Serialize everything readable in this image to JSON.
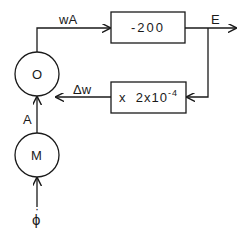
{
  "diagram": {
    "nodes": {
      "o_node": {
        "label": "O"
      },
      "m_node": {
        "label": "M"
      },
      "gain_box": {
        "label": "-200"
      },
      "rate_box": {
        "prefix": "x  2x10",
        "exponent": "-4"
      }
    },
    "edges": {
      "wa": {
        "label": "wA"
      },
      "e": {
        "label": "E"
      },
      "dw": {
        "label": "Δw"
      },
      "a": {
        "label": "A"
      },
      "phi": {
        "label": "ϕ",
        "dot": "·"
      }
    }
  },
  "colors": {
    "stroke": "#1a1a1a",
    "background": "#ffffff"
  }
}
